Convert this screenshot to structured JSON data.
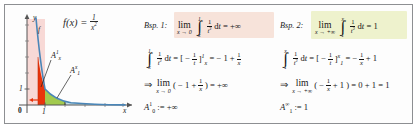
{
  "figure": {
    "caption_type": "improper-integral-worked-examples",
    "function_label": {
      "lhs": "f(x) =",
      "numerator": "1",
      "denominator": "x",
      "denominator_exponent": "2",
      "plain": "f(x) = 1/x^2"
    },
    "graph": {
      "curve_label": "f",
      "x_axis_label": "x",
      "y_axis_label": "y",
      "origin_label": "0",
      "y_tick_label": "1",
      "x_tick_label": "1",
      "area_label_left": {
        "symbol": "A",
        "sub": "x",
        "sup": "1"
      },
      "area_label_right": {
        "symbol": "A",
        "sub": "1",
        "sup": "x"
      },
      "colors": {
        "curve": "#4a86b8",
        "area_pink": "#f6cfcb",
        "area_red": "#e8340c",
        "area_green": "#9ac63f",
        "area_teal": "#bcd9de",
        "axis": "#555555",
        "arrow_red": "#e8340c"
      }
    },
    "examples": [
      {
        "title": "Bsp. 1:",
        "highlight_color": "#f7e3da",
        "line1": {
          "lim_word": "lim",
          "lim_under": "x → 0",
          "int_upper": "1",
          "int_lower": "x",
          "integrand_num": "1",
          "integrand_den": "t",
          "integrand_den_exp": "2",
          "differential": "dt",
          "equals": "= +∞",
          "plain": "lim (x→0) ∫ from x to 1 of 1/t² dt = +∞"
        },
        "line2": {
          "int_upper": "1",
          "int_lower": "x",
          "integrand_num": "1",
          "integrand_den": "t",
          "integrand_den_exp": "2",
          "differential": "dt",
          "eq1": "= [ −",
          "bracket_num": "1",
          "bracket_den": "t",
          "bracket_close": "]",
          "bracket_sup": "1",
          "bracket_sub": "x",
          "eq2": "= − 1 +",
          "tail_num": "1",
          "tail_den": "x",
          "plain": "∫ from x to 1 of 1/t² dt = [ −1/t ]_x^1 = −1 + 1/x"
        },
        "line3": {
          "implies": "⇒",
          "lim_word": "lim",
          "lim_under": "x → 0",
          "expr_open": "( − 1 +",
          "frac_num": "1",
          "frac_den": "x",
          "expr_close": ")",
          "result": "= +∞",
          "plain": "⇒ lim (x→0) ( −1 + 1/x ) = +∞"
        },
        "line4": {
          "symbol": "A",
          "sub": "0",
          "sup": "1",
          "assign": ":= +∞",
          "plain": "A_0^1 := +∞"
        }
      },
      {
        "title": "Bsp. 2:",
        "highlight_color": "#eef2cd",
        "line1": {
          "lim_word": "lim",
          "lim_under": "x → +∞",
          "int_upper": "x",
          "int_lower": "1",
          "integrand_num": "1",
          "integrand_den": "t",
          "integrand_den_exp": "2",
          "differential": "dt",
          "equals": "= 1",
          "plain": "lim (x→+∞) ∫ from 1 to x of 1/t² dt = 1"
        },
        "line2": {
          "int_upper": "x",
          "int_lower": "1",
          "integrand_num": "1",
          "integrand_den": "t",
          "integrand_den_exp": "2",
          "differential": "dt",
          "eq1": "= [ −",
          "bracket_num": "1",
          "bracket_den": "t",
          "bracket_close": "]",
          "bracket_sup": "x",
          "bracket_sub": "1",
          "eq2": "= −",
          "tail_num": "1",
          "tail_den": "x",
          "tail_end": "+ 1",
          "plain": "∫ from 1 to x of 1/t² dt = [ −1/t ]_1^x = −1/x + 1"
        },
        "line3": {
          "implies": "⇒",
          "lim_word": "lim",
          "lim_under": "x → +∞",
          "expr_open": "( −",
          "frac_num": "1",
          "frac_den": "x",
          "expr_mid": "+ 1 )",
          "result": "= 0 + 1 = 1",
          "plain": "⇒ lim (x→+∞) ( −1/x + 1 ) = 0 + 1 = 1"
        },
        "line4": {
          "symbol": "A",
          "sub": "1",
          "sup": "∞",
          "assign": ":= 1",
          "plain": "A_1^∞ := 1"
        }
      }
    ]
  }
}
